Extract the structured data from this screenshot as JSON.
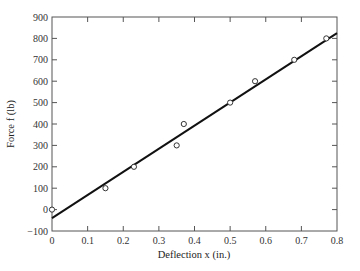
{
  "chart_data": {
    "type": "scatter",
    "title": "",
    "xlabel": "Deflection x (in.)",
    "ylabel": "Force f (lb)",
    "xlim": [
      0,
      0.8
    ],
    "ylim": [
      -100,
      900
    ],
    "xticks": [
      0,
      0.1,
      0.2,
      0.3,
      0.4,
      0.5,
      0.6,
      0.7,
      0.8
    ],
    "xtick_labels": [
      "0",
      "0.1",
      "0.2",
      "0.3",
      "0.4",
      "0.5",
      "0.6",
      "0.7",
      "0.8"
    ],
    "yticks": [
      -100,
      0,
      100,
      200,
      300,
      400,
      500,
      600,
      700,
      800,
      900
    ],
    "ytick_labels": [
      "−100",
      "0",
      "100",
      "200",
      "300",
      "400",
      "500",
      "600",
      "700",
      "800",
      "900"
    ],
    "grid": false,
    "legend": null,
    "series": [
      {
        "name": "Measured data",
        "kind": "scatter",
        "marker": "open-circle",
        "x": [
          0,
          0.15,
          0.23,
          0.35,
          0.37,
          0.5,
          0.57,
          0.68,
          0.77
        ],
        "y": [
          0,
          100,
          200,
          300,
          400,
          500,
          600,
          700,
          800
        ]
      },
      {
        "name": "Linear fit",
        "kind": "line",
        "x": [
          0,
          0.8
        ],
        "y": [
          -40,
          825
        ]
      }
    ]
  },
  "colors": {
    "axis": "#555555",
    "line": "#111111",
    "marker": "#333333"
  }
}
